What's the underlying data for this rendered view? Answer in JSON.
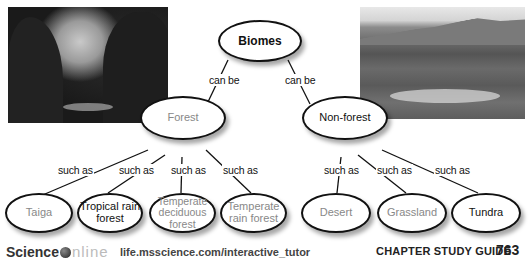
{
  "diagram": {
    "title": "Biomes",
    "root": {
      "label": "Biomes"
    },
    "branches": [
      {
        "link_label": "can be",
        "label": "Forest",
        "children": [
          {
            "link_label": "such as",
            "label": "Taiga"
          },
          {
            "link_label": "such as",
            "label": "Tropical rain forest"
          },
          {
            "link_label": "such as",
            "label": "Temperate deciduous forest"
          },
          {
            "link_label": "such as",
            "label": "Temperate rain forest"
          }
        ]
      },
      {
        "link_label": "can be",
        "label": "Non-forest",
        "children": [
          {
            "link_label": "such as",
            "label": "Desert"
          },
          {
            "link_label": "such as",
            "label": "Grassland"
          },
          {
            "link_label": "such as",
            "label": "Tundra"
          }
        ]
      }
    ]
  },
  "nodes": {
    "biomes": "Biomes",
    "forest": "Forest",
    "nonforest": "Non-forest",
    "taiga": "Taiga",
    "tropical_line1": "Tropical rain",
    "tropical_line2": "forest",
    "temp_dec_line1": "Temperate",
    "temp_dec_line2": "deciduous",
    "temp_dec_line3": "forest",
    "temp_rain_line1": "Temperate",
    "temp_rain_line2": "rain forest",
    "desert": "Desert",
    "grassland": "Grassland",
    "tundra": "Tundra"
  },
  "links": {
    "can_be": "can be",
    "such_as": "such as"
  },
  "photos": {
    "left": "forest-photo",
    "right": "tundra-photo"
  },
  "footer": {
    "logo_science": "Science",
    "logo_online": "nline",
    "url": "life.msscience.com/interactive_tutor",
    "guide": "CHAPTER STUDY GUIDE",
    "page": "763"
  }
}
